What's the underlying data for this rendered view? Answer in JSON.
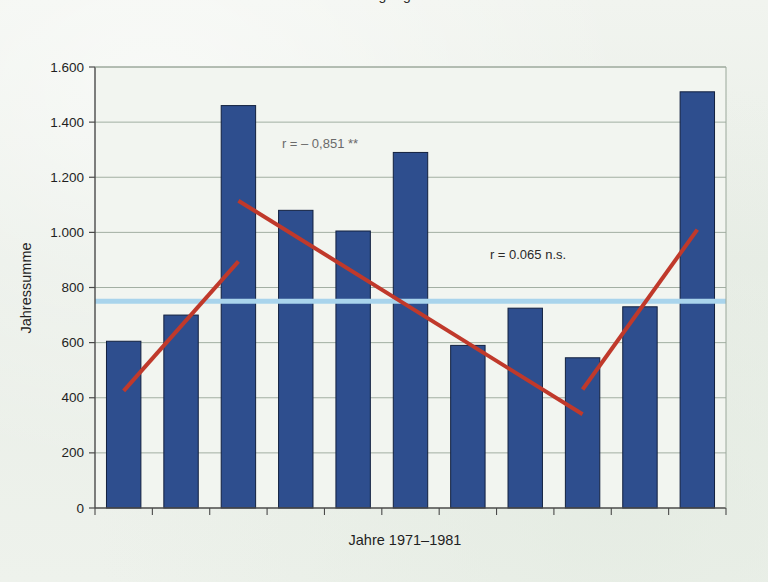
{
  "figure": {
    "cut_off_title": "Abflussganglinie",
    "background_color": "#eef2ec"
  },
  "chart_data": {
    "type": "bar",
    "title": "",
    "xlabel": "Jahre 1971–1981",
    "ylabel": "Jahressumme",
    "categories": [
      "1971",
      "1972",
      "1973",
      "1974",
      "1975",
      "1976",
      "1977",
      "1978",
      "1979",
      "1980",
      "1981"
    ],
    "values": [
      605,
      700,
      1460,
      1080,
      1005,
      1290,
      590,
      725,
      545,
      730,
      1510
    ],
    "ylim": [
      0,
      1600
    ],
    "ytick_values": [
      0,
      200,
      400,
      600,
      800,
      1000,
      1200,
      1400,
      1600
    ],
    "ytick_labels": [
      "0",
      "200",
      "400",
      "600",
      "800",
      "1.000",
      "1.200",
      "1.400",
      "1.600"
    ],
    "grid": "horizontal",
    "legend": "none",
    "bar_color": "#2e4e8e",
    "bar_edge_color": "#12203f",
    "mean_line": {
      "label": "Mittelwert",
      "value": 750,
      "color": "#a9d4ec"
    },
    "trend_lines": [
      {
        "name": "trend-rising-1971-1973",
        "color": "#c0392b",
        "x_start_category": "1971",
        "x_end_category": "1973",
        "y_start": 425,
        "y_end": 895
      },
      {
        "name": "trend-falling-1973-1979",
        "color": "#c0392b",
        "x_start_category": "1973",
        "x_end_category": "1979",
        "y_start": 1115,
        "y_end": 340
      },
      {
        "name": "trend-rising-1979-1981",
        "color": "#c0392b",
        "x_start_category": "1979",
        "x_end_category": "1981",
        "y_start": 430,
        "y_end": 1010
      }
    ],
    "annotations": [
      {
        "name": "correlation-falling",
        "text": "r = – 0,851 **",
        "x": 320,
        "y": 148,
        "faded": true
      },
      {
        "name": "correlation-overall",
        "text": "r = 0.065 n.s.",
        "x": 528,
        "y": 259,
        "faded": false
      }
    ]
  }
}
